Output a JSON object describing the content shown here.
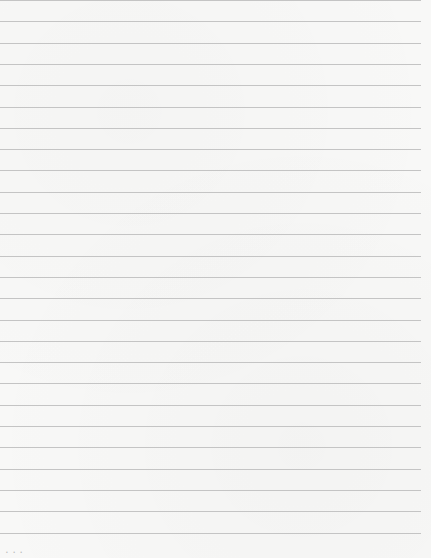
{
  "page": {
    "type": "ruled-notebook-page",
    "background_color": "#f8f8f7",
    "line_color": "#c4c4c4",
    "line_count": 26,
    "first_line_y": 0,
    "line_spacing_px": 21.3,
    "line_width_px": 421
  },
  "footer": {
    "mark": "• • •"
  }
}
